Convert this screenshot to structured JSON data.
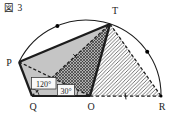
{
  "figure": {
    "label": "図 3"
  },
  "points": {
    "P": "P",
    "T": "T",
    "Q": "Q",
    "O": "O",
    "R": "R"
  },
  "angles": {
    "at_Q": "120°",
    "at_O": "30°"
  },
  "colors": {
    "line": "#1c1c1c",
    "quad_fill": "#c5c5c5",
    "crosshatch_bg": "#b0b0b0",
    "label_box_bg": "#f8f8f8"
  }
}
